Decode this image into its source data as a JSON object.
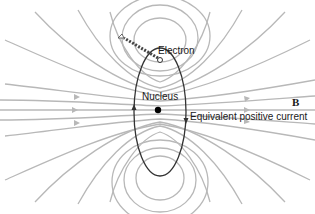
{
  "diagram": {
    "labels": {
      "electron": "Electron",
      "nucleus": "Nucleus",
      "current": "Equivalent positive current",
      "field": "B"
    },
    "colors": {
      "field_lines": "#b8b8b8",
      "orbit": "#333333",
      "text": "#1a1a1a",
      "background": "#ffffff"
    }
  }
}
